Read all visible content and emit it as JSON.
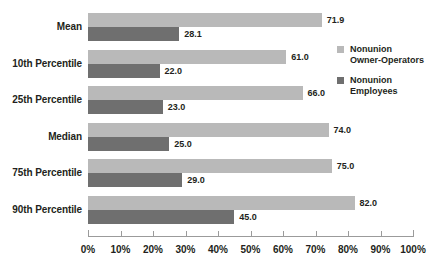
{
  "chart_data": {
    "type": "bar",
    "orientation": "horizontal",
    "title": "",
    "xlabel": "",
    "ylabel": "",
    "xlim": [
      0,
      100
    ],
    "xticks": [
      0,
      10,
      20,
      30,
      40,
      50,
      60,
      70,
      80,
      90,
      100
    ],
    "xtick_labels": [
      "0%",
      "10%",
      "20%",
      "30%",
      "40%",
      "50%",
      "60%",
      "70%",
      "80%",
      "90%",
      "100%"
    ],
    "grid": false,
    "legend_position": "right",
    "categories": [
      "Mean",
      "10th Percentile",
      "25th Percentile",
      "Median",
      "75th Percentile",
      "90th Percentile"
    ],
    "series": [
      {
        "name": "Nonunion Owner-Operators",
        "color": "#b9b9b9",
        "values": [
          71.9,
          61.0,
          66.0,
          74.0,
          75.0,
          82.0
        ],
        "value_labels": [
          "71.9",
          "61.0",
          "66.0",
          "74.0",
          "75.0",
          "82.0"
        ]
      },
      {
        "name": "Nonunion Employees",
        "color": "#6f6f6f",
        "values": [
          28.1,
          22.0,
          23.0,
          25.0,
          29.0,
          45.0
        ],
        "value_labels": [
          "28.1",
          "22.0",
          "23.0",
          "25.0",
          "29.0",
          "45.0"
        ]
      }
    ]
  },
  "legend": {
    "items": [
      {
        "swatch": "light",
        "line1": "Nonunion",
        "line2": "Owner-Operators"
      },
      {
        "swatch": "dark",
        "line1": "Nonunion",
        "line2": "Employees"
      }
    ]
  },
  "colors": {
    "series_light": "#b9b9b9",
    "series_dark": "#6f6f6f",
    "axis": "#9b9b9b",
    "text": "#231f20",
    "background": "#ffffff"
  }
}
